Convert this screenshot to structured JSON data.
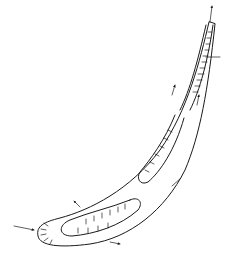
{
  "figure": {
    "labels": [],
    "line_color": "#1a1a1a",
    "background": "#ffffff"
  }
}
